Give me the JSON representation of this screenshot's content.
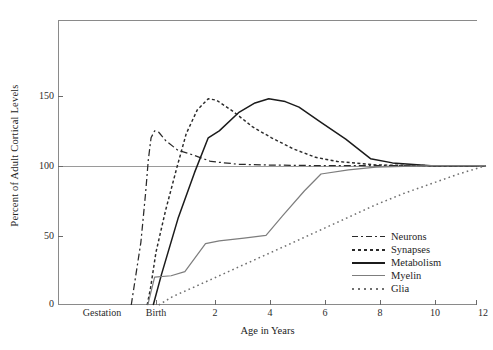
{
  "chart_data": {
    "type": "line",
    "title": "",
    "xlabel": "Age in Years",
    "ylabel": "Percent of Adult Cortical Levels",
    "xlim": [
      -0.9,
      12
    ],
    "ylim": [
      0,
      190
    ],
    "grid": false,
    "reference_line": {
      "y": 100,
      "label": "100% adult level"
    },
    "y_ticks": [
      0,
      50,
      100,
      150
    ],
    "y_tick_labels": [
      "0",
      "50",
      "100",
      "150"
    ],
    "x_ticks": [
      -0.9,
      0,
      2,
      4,
      6,
      8,
      10,
      12
    ],
    "x_tick_labels": [
      "Gestation",
      "Birth",
      "2",
      "4",
      "6",
      "8",
      "10",
      "12"
    ],
    "legend_position": "lower right",
    "series": [
      {
        "name": "Neurons",
        "style": "dash-dot",
        "color": "#2a2a2a",
        "x": [
          -0.9,
          -0.55,
          -0.38,
          -0.28,
          -0.18,
          -0.05,
          0.1,
          0.35,
          0.8,
          1.3,
          2.0,
          3.0,
          4.0,
          6.0,
          8.0,
          10.0,
          12.0
        ],
        "y": [
          0,
          45,
          80,
          104,
          120,
          125,
          124,
          118,
          111,
          108,
          103,
          101,
          100.5,
          100,
          100,
          100,
          100
        ]
      },
      {
        "name": "Synapses",
        "style": "dashed",
        "color": "#2a2a2a",
        "x": [
          -0.32,
          -0.2,
          0.0,
          0.35,
          0.75,
          1.1,
          1.5,
          1.9,
          2.2,
          2.8,
          3.5,
          4.2,
          5.0,
          5.8,
          6.6,
          8.0,
          10.0,
          12.0
        ],
        "y": [
          0,
          12,
          38,
          68,
          98,
          123,
          140,
          148,
          147,
          139,
          128,
          120,
          112,
          106,
          103,
          100.5,
          100,
          100
        ]
      },
      {
        "name": "Metabolism",
        "style": "solid",
        "color": "#1b1b1b",
        "x": [
          -0.1,
          0.2,
          0.8,
          1.4,
          1.9,
          2.3,
          3.0,
          3.6,
          4.1,
          4.7,
          5.2,
          6.0,
          6.9,
          7.8,
          8.6,
          10.0,
          12.0
        ],
        "y": [
          0,
          22,
          62,
          95,
          120,
          125,
          138,
          145,
          148,
          146,
          142,
          131,
          119,
          105,
          102,
          100,
          100
        ]
      },
      {
        "name": "Myelin",
        "style": "solid-light",
        "color": "#7d7d7d",
        "x": [
          -0.3,
          -0.2,
          -0.05,
          0.55,
          1.05,
          1.8,
          2.3,
          3.2,
          4.0,
          4.6,
          5.4,
          6.0,
          7.0,
          8.0,
          10.0,
          12.0
        ],
        "y": [
          0,
          8,
          20,
          21,
          24,
          44,
          46,
          48,
          50,
          64,
          82,
          94,
          97,
          99,
          100,
          100
        ]
      },
      {
        "name": "Glia",
        "style": "dotted",
        "color": "#6f6f6f",
        "x": [
          0.1,
          0.6,
          1.4,
          2.3,
          3.2,
          4.1,
          5.0,
          6.0,
          7.0,
          8.0,
          9.0,
          10.0,
          11.0,
          12.0
        ],
        "y": [
          0,
          6,
          13,
          21,
          29,
          37,
          45,
          54,
          63,
          72,
          80,
          87,
          94,
          100
        ]
      }
    ]
  },
  "legend": {
    "items": [
      {
        "label": "Neurons"
      },
      {
        "label": "Synapses"
      },
      {
        "label": "Metabolism"
      },
      {
        "label": "Myelin"
      },
      {
        "label": "Glia"
      }
    ]
  },
  "axes": {
    "y_title": "Percent of Adult Cortical Levels",
    "x_title": "Age in Years",
    "y_labels": [
      "150",
      "100",
      "50",
      "0"
    ],
    "x_labels": [
      "Gestation",
      "Birth",
      "2",
      "4",
      "6",
      "8",
      "10",
      "12"
    ]
  }
}
